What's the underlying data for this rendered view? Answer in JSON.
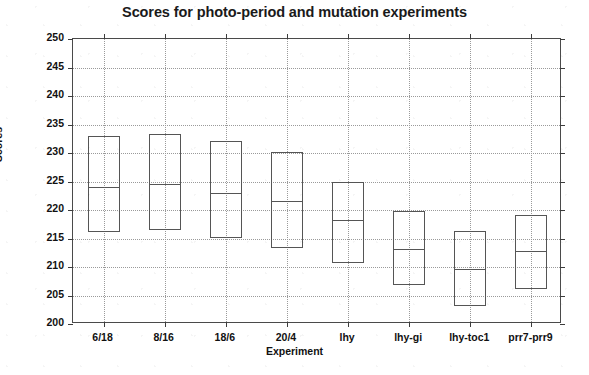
{
  "chart_data": {
    "type": "bar",
    "title": "Scores for photo-period and mutation experiments",
    "xlabel": "Experiment",
    "ylabel": "Scores",
    "categories": [
      "6/18",
      "8/16",
      "18/6",
      "20/4",
      "lhy",
      "lhy-gi",
      "lhy-toc1",
      "prr7-prr9"
    ],
    "ylim": [
      200,
      250
    ],
    "yticks": [
      200,
      205,
      210,
      215,
      220,
      225,
      230,
      235,
      240,
      245,
      250
    ],
    "ytick_labels": [
      "200",
      "205",
      "210",
      "215",
      "220",
      "225",
      "230",
      "235",
      "240",
      "245",
      "250"
    ],
    "grid": true,
    "legend": "none",
    "series": [
      {
        "name": "box-top",
        "values": [
          232.9,
          233.4,
          232.1,
          230.1,
          224.9,
          219.8,
          216.3,
          219.1
        ]
      },
      {
        "name": "median",
        "values": [
          224.0,
          224.6,
          223.0,
          221.5,
          218.2,
          213.2,
          209.6,
          212.8
        ]
      },
      {
        "name": "box-bottom",
        "values": [
          216.1,
          216.5,
          215.1,
          213.4,
          210.7,
          206.8,
          203.2,
          206.1
        ]
      }
    ],
    "boxes": [
      {
        "category": "6/18",
        "top": 232.9,
        "median": 224.0,
        "bottom": 216.1
      },
      {
        "category": "8/16",
        "top": 233.4,
        "median": 224.6,
        "bottom": 216.5
      },
      {
        "category": "18/6",
        "top": 232.1,
        "median": 223.0,
        "bottom": 215.1
      },
      {
        "category": "20/4",
        "top": 230.1,
        "median": 221.5,
        "bottom": 213.4
      },
      {
        "category": "lhy",
        "top": 224.9,
        "median": 218.2,
        "bottom": 210.7
      },
      {
        "category": "lhy-gi",
        "top": 219.8,
        "median": 213.2,
        "bottom": 206.8
      },
      {
        "category": "lhy-toc1",
        "top": 216.3,
        "median": 209.6,
        "bottom": 203.2
      },
      {
        "category": "prr7-prr9",
        "top": 219.1,
        "median": 212.8,
        "bottom": 206.1
      }
    ],
    "colors": {
      "box_edge": "#555555",
      "axis": "#4a4a4a",
      "grid": "#9a9a9a",
      "text": "#111111",
      "background": "#ffffff"
    }
  }
}
